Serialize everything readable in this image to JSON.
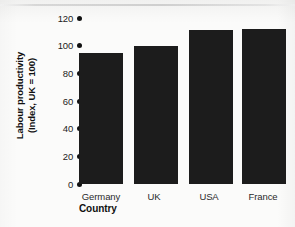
{
  "chart_data": {
    "type": "bar",
    "title": "",
    "subtitle": "",
    "categories": [
      "Germany",
      "UK",
      "USA",
      "France"
    ],
    "values": [
      95,
      100,
      111,
      112
    ],
    "xlabel": "Country",
    "ylabel_line1": "Labour productivity",
    "ylabel_line2": "(Index, UK = 100)",
    "ylabel": "Labour productivity (Index, UK = 100)",
    "ylim": [
      0,
      120
    ],
    "yticks": [
      120,
      100,
      80,
      60,
      40,
      20,
      0
    ],
    "ytick_labels": [
      "120",
      "100",
      "80",
      "60",
      "40",
      "20",
      "0"
    ],
    "grid": false,
    "legend": false,
    "legend_position": "none",
    "tick_marker": "filled-circle",
    "bar_color": "#1c1c1c",
    "background_color": "#fbfbfa",
    "text_color": "#111111"
  }
}
